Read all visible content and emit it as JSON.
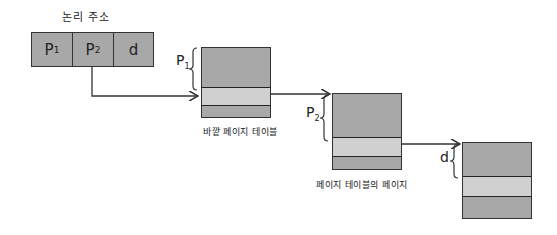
{
  "logical_address": {
    "title": "논리 주소",
    "fields": [
      {
        "base": "P",
        "sub": "1"
      },
      {
        "base": "P",
        "sub": "2"
      },
      {
        "base": "d",
        "sub": ""
      }
    ]
  },
  "tables": [
    {
      "caption": "바깥 페이지 테이블",
      "brace": {
        "base": "P",
        "sub": "1"
      }
    },
    {
      "caption": "페이지 테이블의 페이지",
      "brace": {
        "base": "P",
        "sub": "2"
      }
    },
    {
      "caption": "",
      "brace": {
        "base": "d",
        "sub": ""
      }
    }
  ],
  "colors": {
    "box_fill": "#a8a8a8",
    "entry_fill": "#d0d0d0",
    "stroke": "#333333"
  }
}
